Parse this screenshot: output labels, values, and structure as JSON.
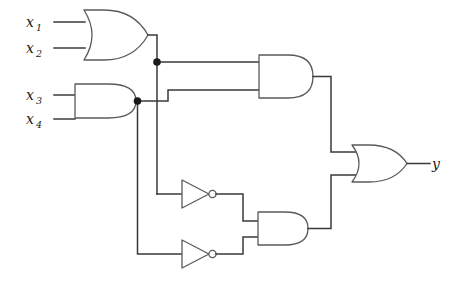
{
  "diagram": {
    "expression": "y = ((x1 + x2) AND (x3 AND x4)) OR (NOT(x1 + x2) AND NOT(x3 AND x4))",
    "background_color": "#ffffff",
    "wire_color": "#3a3a3a",
    "gate_outline_color": "#5a5a5a",
    "junction_color": "#1a1a1a"
  },
  "inputs": [
    {
      "id": "x1",
      "base": "x",
      "sub": "1",
      "x": 30,
      "y": 22
    },
    {
      "id": "x2",
      "base": "x",
      "sub": "2",
      "x": 30,
      "y": 48
    },
    {
      "id": "x3",
      "base": "x",
      "sub": "3",
      "x": 30,
      "y": 95
    },
    {
      "id": "x4",
      "base": "x",
      "sub": "4",
      "x": 30,
      "y": 119
    }
  ],
  "outputs": [
    {
      "id": "y",
      "base": "y",
      "sub": "",
      "x": 436,
      "y": 163
    }
  ],
  "gates": [
    {
      "id": "or-1",
      "type": "OR",
      "label": "OR",
      "inputs": [
        "x1",
        "x2"
      ],
      "output_net": "n1"
    },
    {
      "id": "and-1",
      "type": "AND",
      "label": "AND",
      "inputs": [
        "x3",
        "x4"
      ],
      "output_net": "n2"
    },
    {
      "id": "and-2",
      "type": "AND",
      "label": "AND",
      "inputs": [
        "n1",
        "n2"
      ],
      "output_net": "n3"
    },
    {
      "id": "not-1",
      "type": "NOT",
      "label": "NOT",
      "inputs": [
        "n1"
      ],
      "output_net": "n4"
    },
    {
      "id": "not-2",
      "type": "NOT",
      "label": "NOT",
      "inputs": [
        "n2"
      ],
      "output_net": "n5"
    },
    {
      "id": "and-3",
      "type": "AND",
      "label": "AND",
      "inputs": [
        "n4",
        "n5"
      ],
      "output_net": "n6"
    },
    {
      "id": "or-2",
      "type": "OR",
      "label": "OR",
      "inputs": [
        "n3",
        "n6"
      ],
      "output_net": "y"
    }
  ],
  "junctions": [
    {
      "id": "junction-n1",
      "net": "n1",
      "x": 157,
      "y": 62
    },
    {
      "id": "junction-n2",
      "net": "n2",
      "x": 137.5,
      "y": 101
    }
  ]
}
